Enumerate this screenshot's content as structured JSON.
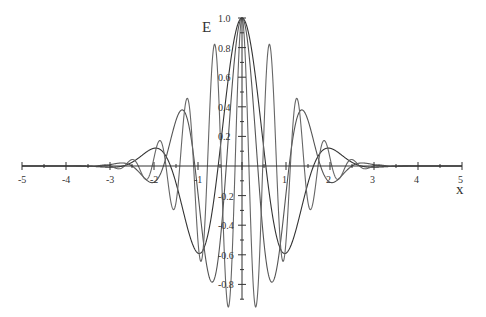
{
  "chart_data": {
    "type": "line",
    "title": "",
    "xlabel": "x",
    "ylabel": "E",
    "xlim": [
      -5,
      5
    ],
    "ylim": [
      -0.9,
      1.0
    ],
    "grid": false,
    "legend": null,
    "x_ticks": [
      -5,
      -4,
      -3,
      -2,
      -1,
      1,
      2,
      3,
      4,
      5
    ],
    "x_tick_labels": [
      "-5",
      "-4",
      "-3",
      "-2",
      "-1",
      "1",
      "2",
      "3",
      "4",
      "5"
    ],
    "y_ticks": [
      1.0,
      0.8,
      0.6,
      0.4,
      0.2,
      -0.2,
      -0.4,
      -0.6,
      -0.8
    ],
    "y_tick_labels": [
      "1.0",
      "0.8",
      "0.6",
      "0.4",
      "0.2",
      "-0.2",
      "-0.4",
      "-0.6",
      "-0.8"
    ],
    "series": [
      {
        "name": "wave packet (low frequency)",
        "formula": "exp(-x^2/2)*cos(2.9x)",
        "color": "#333333"
      },
      {
        "name": "wave packet (mid frequency)",
        "formula": "exp(-x^2/2)*cos(4.4x)",
        "color": "#555555"
      },
      {
        "name": "wave packet (high frequency)",
        "formula": "exp(-x^2/2)*cos(10x)",
        "color": "#666666"
      }
    ],
    "sample_points": {
      "x": [
        -3,
        -2,
        -1.45,
        -1.1,
        -0.6,
        0,
        0.6,
        1.1,
        1.45,
        2,
        3
      ],
      "low_frequency": [
        0.01,
        0.12,
        0.0,
        -0.5,
        0.0,
        1.0,
        0.0,
        -0.5,
        0.0,
        0.12,
        0.01
      ],
      "mid_frequency": [
        0.0,
        -0.2,
        0.45,
        0.0,
        -0.7,
        1.0,
        -0.7,
        0.0,
        0.45,
        -0.2,
        0.0
      ]
    }
  },
  "axes": {
    "x_title": "x",
    "y_title": "E"
  }
}
